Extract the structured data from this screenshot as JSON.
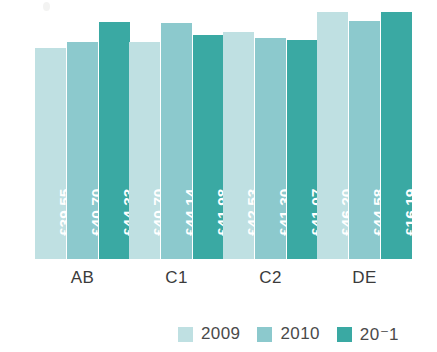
{
  "chart_data": {
    "type": "bar",
    "title": "",
    "subtitle": "",
    "xlabel": "",
    "ylabel": "",
    "grid": false,
    "legend_position": "bottom-right",
    "currency_symbol": "£",
    "categories": [
      "AB",
      "C1",
      "C2",
      "DE"
    ],
    "ylim": [
      0,
      48.5
    ],
    "series": [
      {
        "name": "2009",
        "color": "#bfe0e2",
        "values": [
          39.55,
          40.7,
          42.53,
          46.2
        ],
        "labels": [
          "£39.55",
          "£40.70",
          "£42.53",
          "£46.20"
        ]
      },
      {
        "name": "2010",
        "color": "#8cc9cd",
        "values": [
          40.7,
          44.14,
          41.3,
          44.58
        ],
        "labels": [
          "£40.70",
          "£44.14",
          "£41.30",
          "£44.58"
        ]
      },
      {
        "name": "2011",
        "color": "#3aa9a3",
        "values": [
          44.33,
          41.98,
          41.07,
          46.19
        ],
        "labels": [
          "£44.33",
          "£41.98",
          "£41.07",
          "£16.19"
        ]
      }
    ],
    "bars": [
      {
        "category": "AB",
        "series": "2009",
        "value": 39.55,
        "label": "£39.55",
        "color": "#bfe0e2"
      },
      {
        "category": "AB",
        "series": "2010",
        "value": 40.7,
        "label": "£40.70",
        "color": "#8cc9cd"
      },
      {
        "category": "AB",
        "series": "2011",
        "value": 44.33,
        "label": "£44.33",
        "color": "#3aa9a3"
      },
      {
        "category": "C1",
        "series": "2009",
        "value": 43.35,
        "label": "£43.35",
        "color": "#bfe0e2"
      },
      {
        "category": "C1",
        "series": "2010",
        "value": 44.14,
        "label": "£44.14",
        "color": "#8cc9cd"
      },
      {
        "category": "C1",
        "series": "2011",
        "value": 41.98,
        "label": "£41.98",
        "color": "#3aa9a3"
      },
      {
        "category": "C2",
        "series": "2009",
        "value": 42.53,
        "label": "£42.53",
        "color": "#bfe0e2"
      },
      {
        "category": "C2",
        "series": "2010",
        "value": 41.3,
        "label": "£41.30",
        "color": "#8cc9cd"
      },
      {
        "category": "C2",
        "series": "2011",
        "value": 41.07,
        "label": "£41.07",
        "color": "#3aa9a3"
      },
      {
        "category": "DE",
        "series": "2009",
        "value": 46.2,
        "label": "£46.20",
        "color": "#bfe0e2"
      },
      {
        "category": "DE",
        "series": "2010",
        "value": 44.58,
        "label": "£44.58",
        "color": "#8cc9cd"
      },
      {
        "category": "DE",
        "series": "2011",
        "value": 46.19,
        "label": "£16.19",
        "color": "#3aa9a3"
      }
    ]
  },
  "legend": {
    "entries": [
      {
        "label": "2009",
        "color": "#bfe0e2"
      },
      {
        "label": "2010",
        "color": "#8cc9cd"
      },
      {
        "label": "20⁻1",
        "color": "#3aa9a3"
      }
    ]
  },
  "axis": {
    "categories": [
      {
        "label": "AB"
      },
      {
        "label": "C1"
      },
      {
        "label": "C2"
      },
      {
        "label": "DE"
      }
    ]
  }
}
